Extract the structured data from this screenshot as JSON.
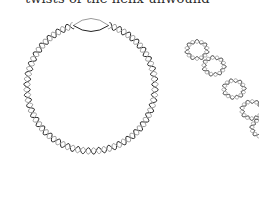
{
  "caption": "twists of the helix unwound",
  "figures": [
    {
      "id": "relaxed-circle",
      "description": "relaxed circular DNA with a locally unwound region"
    },
    {
      "id": "supercoiled",
      "description": "supercoiled DNA"
    }
  ],
  "colors": {
    "strand_dark": "#222222",
    "strand_light": "#9a9a9a",
    "background": "#ffffff"
  }
}
